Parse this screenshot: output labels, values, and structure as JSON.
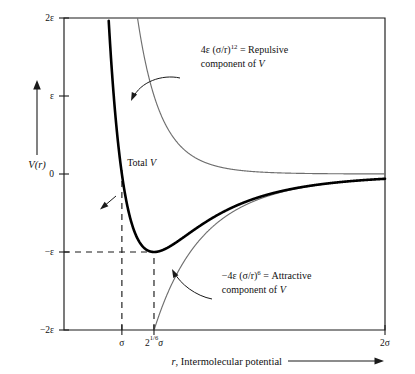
{
  "chart_data": {
    "type": "line",
    "title": "",
    "xlabel": "r, Intermolecular potential",
    "ylabel": "V(r)",
    "xlim": [
      0.78,
      2.0
    ],
    "ylim": [
      -2,
      2
    ],
    "grid": false,
    "legend_position": "inline-annotations",
    "x_unit": "sigma",
    "y_unit": "epsilon",
    "x_ticks": [
      {
        "value": 1.0,
        "label": "σ"
      },
      {
        "value": 1.122,
        "label": "2",
        "sup": "1/6",
        "suffix": "σ"
      },
      {
        "value": 2.0,
        "label": "2σ"
      }
    ],
    "y_ticks": [
      {
        "value": 2,
        "label": "2ε"
      },
      {
        "value": 1,
        "label": "ε"
      },
      {
        "value": 0,
        "label": "0"
      },
      {
        "value": -1,
        "label": "−ε"
      },
      {
        "value": -2,
        "label": "−2ε"
      }
    ],
    "series": [
      {
        "name": "Total V",
        "formula": "4*((1/x)^12 - (1/x)^6)",
        "style": "thick-black",
        "color": "#000000",
        "minimum": {
          "x": 1.122,
          "y": -1
        },
        "zero_crossing": {
          "x": 1.0,
          "y": 0
        }
      },
      {
        "name": "Repulsive component of V",
        "formula": "4*(1/x)^12",
        "style": "thin-gray",
        "color": "#6f6f6f"
      },
      {
        "name": "Attractive component of V",
        "formula": "-4*(1/x)^6",
        "style": "thin-gray",
        "color": "#6f6f6f"
      }
    ],
    "annotations": [
      {
        "id": "repulsive",
        "prefix": "4ε (σ/r)",
        "sup": "12",
        "rest": " = Repulsive",
        "line2": "component of V",
        "x": 1.3,
        "y": 1.55
      },
      {
        "id": "attractive",
        "prefix": "−4ε (σ/r)",
        "sup": "6",
        "rest": " = Attractive",
        "line2": "component of V",
        "x": 1.38,
        "y": -1.35
      },
      {
        "id": "total",
        "prefix": "Total V",
        "sup": "",
        "rest": "",
        "line2": "",
        "x": 1.02,
        "y": 0.1
      }
    ],
    "guide_lines": [
      {
        "type": "vertical",
        "x": 1.0,
        "from_y": -2,
        "to_y": 0.05
      },
      {
        "type": "vertical",
        "x": 1.122,
        "from_y": -2,
        "to_y": -1
      },
      {
        "type": "horizontal",
        "y": -1,
        "from_x": 0.78,
        "to_x": 1.122
      }
    ]
  },
  "axis": {
    "y_label": "V(r)",
    "x_label": "r, Intermolecular potential"
  }
}
